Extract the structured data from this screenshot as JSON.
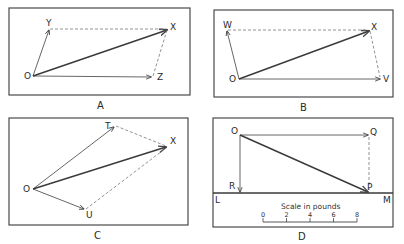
{
  "panels": [
    {
      "id": "A",
      "caption": "A",
      "points": {
        "origin": "O",
        "p1": "Y",
        "result": "X",
        "p2": "Z"
      }
    },
    {
      "id": "B",
      "caption": "B",
      "points": {
        "origin": "O",
        "p1": "W",
        "result": "X",
        "p2": "V"
      }
    },
    {
      "id": "C",
      "caption": "C",
      "points": {
        "origin": "O",
        "p1": "T",
        "result": "X",
        "p2": "U"
      }
    },
    {
      "id": "D",
      "caption": "D",
      "points": {
        "origin": "O",
        "q": "Q",
        "p": "P",
        "r": "R",
        "left": "L",
        "right": "M"
      },
      "scale": {
        "title": "Scale in pounds",
        "ticks": [
          "0",
          "2",
          "4",
          "6",
          "8"
        ]
      }
    }
  ]
}
